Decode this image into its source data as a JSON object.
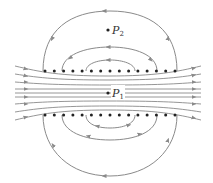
{
  "colors": {
    "line": "#8a8a8a",
    "arrow": "#8a8a8a",
    "dot": "#222222",
    "label": "#333333"
  },
  "points": [
    {
      "id": "P2",
      "letter": "P",
      "subscript": "2",
      "x": 108,
      "y": 30
    },
    {
      "id": "P1",
      "letter": "P",
      "subscript": "1",
      "x": 108,
      "y": 93
    }
  ],
  "wire_rows": {
    "top_y": 71,
    "bottom_y": 115,
    "x_start": 45,
    "x_end": 175,
    "count": 15,
    "symbol": "dot (current out of page)"
  },
  "field_lines": {
    "central_straight_count": 7,
    "direction": "left-to-right through center",
    "top_loops": 3,
    "bottom_loops": 3
  }
}
